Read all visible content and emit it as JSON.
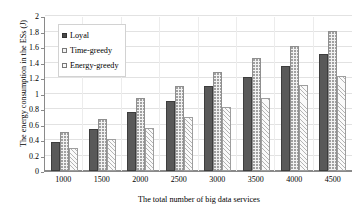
{
  "chart_data": {
    "type": "bar",
    "title": "",
    "xlabel": "The total number of big data services",
    "ylabel": "The energy consumption in the ESs (J)",
    "categories": [
      "1000",
      "1500",
      "2000",
      "2500",
      "3000",
      "3500",
      "4000",
      "4500"
    ],
    "series": [
      {
        "name": "Loyal",
        "values": [
          0.38,
          0.55,
          0.77,
          0.91,
          1.11,
          1.22,
          1.37,
          1.52
        ]
      },
      {
        "name": "Time-greedy",
        "values": [
          0.51,
          0.68,
          0.95,
          1.11,
          1.28,
          1.47,
          1.63,
          1.82
        ]
      },
      {
        "name": "Energy-greedy",
        "values": [
          0.3,
          0.42,
          0.56,
          0.7,
          0.83,
          0.95,
          1.12,
          1.24
        ]
      }
    ],
    "ylim": [
      0,
      2
    ],
    "yticks": [
      "0",
      "0.2",
      "0.4",
      "0.6",
      "0.8",
      "1",
      "1.2",
      "1.4",
      "1.6",
      "1.8",
      "2"
    ],
    "ytick_step": 0.2,
    "grid": true,
    "legend_position": "top-left",
    "colors": {
      "loyal": "#595959",
      "time_greedy": "#f2f2f2",
      "energy_greedy": "#fafafa",
      "gridline": "#e2e2e2",
      "axis": "#8a8a8a"
    }
  }
}
